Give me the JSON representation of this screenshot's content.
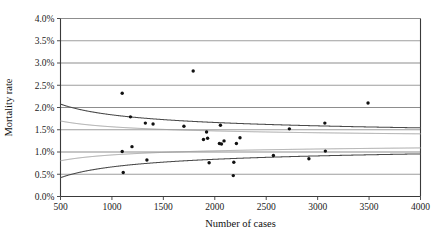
{
  "chart_data": {
    "type": "scatter",
    "title": "",
    "subtitle": "",
    "xlabel": "Number of cases",
    "ylabel": "Mortality rate",
    "xlim": [
      500,
      4000
    ],
    "ylim": [
      0.0,
      4.0
    ],
    "xticks": [
      500,
      1000,
      1500,
      2000,
      2500,
      3000,
      3500,
      4000
    ],
    "xtick_labels": [
      "500",
      "1000",
      "1500",
      "2000",
      "2500",
      "3000",
      "3500",
      "4000"
    ],
    "yticks": [
      0.0,
      0.5,
      1.0,
      1.5,
      2.0,
      2.5,
      3.0,
      3.5,
      4.0
    ],
    "ytick_labels": [
      "0.0%",
      "0.5%",
      "1.0%",
      "1.5%",
      "2.0%",
      "2.5%",
      "3.0%",
      "3.5%",
      "4.0%"
    ],
    "grid": true,
    "grid_axis": "y",
    "legend": false,
    "legend_position": "none",
    "plot_kind": "funnel-plot",
    "points_units": {
      "x": "cases",
      "y": "percent"
    },
    "points": [
      {
        "x": 1100,
        "y": 2.32
      },
      {
        "x": 1100,
        "y": 1.01
      },
      {
        "x": 1110,
        "y": 0.54
      },
      {
        "x": 1180,
        "y": 1.79
      },
      {
        "x": 1195,
        "y": 1.12
      },
      {
        "x": 1325,
        "y": 1.65
      },
      {
        "x": 1340,
        "y": 0.82
      },
      {
        "x": 1400,
        "y": 1.63
      },
      {
        "x": 1700,
        "y": 1.58
      },
      {
        "x": 1790,
        "y": 2.82
      },
      {
        "x": 1890,
        "y": 1.28
      },
      {
        "x": 1920,
        "y": 1.45
      },
      {
        "x": 1930,
        "y": 1.31
      },
      {
        "x": 1945,
        "y": 0.76
      },
      {
        "x": 2045,
        "y": 1.19
      },
      {
        "x": 2055,
        "y": 1.6
      },
      {
        "x": 2065,
        "y": 1.18
      },
      {
        "x": 2090,
        "y": 1.25
      },
      {
        "x": 2180,
        "y": 0.47
      },
      {
        "x": 2185,
        "y": 0.77
      },
      {
        "x": 2210,
        "y": 1.19
      },
      {
        "x": 2245,
        "y": 1.32
      },
      {
        "x": 2570,
        "y": 0.92
      },
      {
        "x": 2725,
        "y": 1.52
      },
      {
        "x": 2915,
        "y": 0.85
      },
      {
        "x": 3070,
        "y": 1.65
      },
      {
        "x": 3075,
        "y": 1.02
      },
      {
        "x": 3490,
        "y": 2.1
      }
    ],
    "curves": [
      {
        "name": "outer-upper-limit",
        "center": 1.25,
        "k": 18.5,
        "side": "upper",
        "color": "#4a4a4a"
      },
      {
        "name": "outer-lower-limit",
        "center": 1.25,
        "k": 18.5,
        "side": "lower",
        "color": "#4a4a4a"
      },
      {
        "name": "inner-upper-limit",
        "center": 1.25,
        "k": 10.0,
        "side": "upper",
        "color": "#9a9a9a"
      },
      {
        "name": "inner-lower-limit",
        "center": 1.25,
        "k": 10.0,
        "side": "lower",
        "color": "#9a9a9a"
      }
    ],
    "colors": {
      "point": "#111111",
      "outer_limit": "#4a4a4a",
      "inner_limit": "#9a9a9a",
      "grid": "#8d8d8d",
      "axis": "#3a3a3a",
      "background": "#ffffff"
    }
  }
}
